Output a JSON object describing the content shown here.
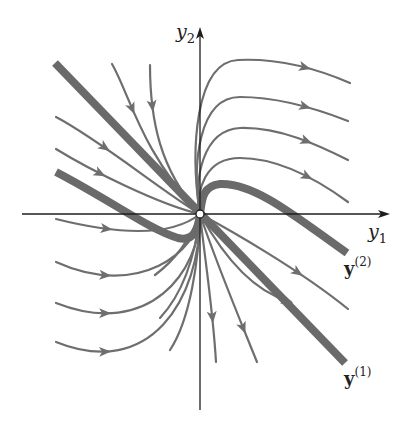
{
  "figure": {
    "type": "phase-portrait",
    "colors": {
      "background": "#ffffff",
      "axis": "#1e1e1e",
      "trajectory": "#6e6e6e",
      "eigen": "#6a6a6a",
      "label": "#222222"
    },
    "origin": [
      200,
      214
    ],
    "axes": {
      "x": {
        "label": "y",
        "subscript": "1",
        "from": [
          22,
          214
        ],
        "to": [
          390,
          214
        ],
        "label_pos": [
          368,
          238
        ]
      },
      "y": {
        "label": "y",
        "subscript": "2",
        "from": [
          200,
          410
        ],
        "to": [
          200,
          27
        ],
        "label_pos": [
          176,
          38
        ]
      }
    },
    "eigen_labels": [
      {
        "name": "y2-label",
        "text": "y",
        "sup": "(2)",
        "pos": [
          344,
          275
        ]
      },
      {
        "name": "y1-label",
        "text": "y",
        "sup": "(1)",
        "pos": [
          344,
          385
        ]
      }
    ],
    "eigen_curves": [
      {
        "name": "eigen-line-y1",
        "d": "M55,63 L345,363"
      },
      {
        "name": "eigen-curve-y2-left",
        "d": "M56,172 C110,200 150,230 178,238 C195,242 198,228 200,214"
      },
      {
        "name": "eigen-curve-y2-right",
        "d": "M200,214 C202,200 202,186 220,184 C255,182 300,220 347,253"
      }
    ],
    "trajectories": [
      {
        "d": "M200,214 C190,150 195,62 238,60 C280,58 320,70 350,83",
        "arrow": [
          305,
          69,
          1
        ]
      },
      {
        "d": "M200,214 C192,165 198,97 240,97 C280,97 320,110 348,121",
        "arrow": [
          305,
          106,
          1
        ]
      },
      {
        "d": "M200,214 C194,180 202,130 240,128 C280,127 318,145 348,160",
        "arrow": [
          305,
          144,
          1
        ]
      },
      {
        "d": "M200,214 C196,190 205,158 240,158 C278,158 318,180 348,202",
        "arrow": [
          305,
          181,
          1
        ]
      },
      {
        "d": "M200,214 C230,230 300,270 348,309",
        "arrow": [
          300,
          270,
          1
        ]
      },
      {
        "d": "M200,214 C140,150 130,95 112,64",
        "arrow": [
          129,
          110,
          -1
        ]
      },
      {
        "d": "M200,214 C160,170 150,120 150,65",
        "arrow": [
          152,
          106,
          -1
        ]
      },
      {
        "d": "M200,214 C160,190 100,140 56,117",
        "arrow": [
          98,
          157,
          -1
        ]
      },
      {
        "d": "M200,214 C160,205 90,170 56,149",
        "arrow": [
          102,
          170,
          -1
        ]
      },
      {
        "d": "M200,214 C180,230 140,240 56,219",
        "arrow": [
          105,
          243,
          -1
        ]
      },
      {
        "d": "M200,214 C198,250 140,300 56,262",
        "arrow": [
          105,
          282,
          -1
        ]
      },
      {
        "d": "M200,214 C200,270 150,340 56,303",
        "arrow": [
          105,
          318,
          -1
        ]
      },
      {
        "d": "M200,214 C200,300 150,380 56,342",
        "arrow": [
          105,
          356,
          -1
        ]
      },
      {
        "d": "M200,214 C205,260 213,310 216,362",
        "arrow": [
          214,
          317,
          1
        ]
      },
      {
        "d": "M200,214 C215,260 240,320 257,362",
        "arrow": [
          247,
          326,
          1
        ]
      },
      {
        "d": "M200,214 C220,250 250,290 288,301",
        "arrow": [
          288,
          300,
          1
        ]
      },
      {
        "d": "M200,214 C190,240 175,260 155,275",
        "arrow": null
      },
      {
        "d": "M200,214 C196,250 186,290 160,318",
        "arrow": null
      },
      {
        "d": "M200,214 C199,260 190,320 170,350",
        "arrow": null
      }
    ],
    "origin_marker": {
      "r": 4,
      "fill": "#ffffff",
      "stroke": "#1e1e1e"
    }
  }
}
